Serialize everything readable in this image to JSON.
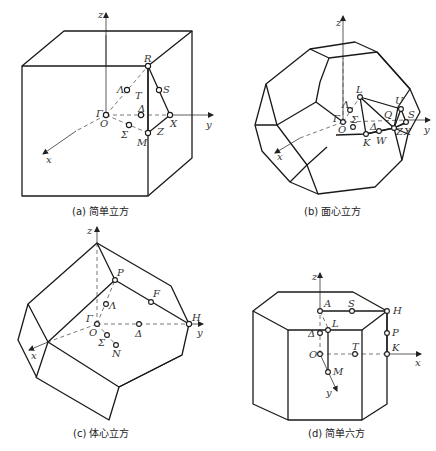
{
  "figure": {
    "panels": [
      {
        "id": "a",
        "caption": "(a) 简单立方",
        "axes": {
          "x": "x",
          "y": "y",
          "z": "z"
        },
        "points": {
          "Gamma": "Γ",
          "O": "O",
          "R": "R",
          "S": "S",
          "T": "T",
          "Lambda": "Λ",
          "Delta": "Δ",
          "X": "X",
          "Z": "Z",
          "M": "M",
          "Sigma": "Σ"
        }
      },
      {
        "id": "b",
        "caption": "(b) 面心立方",
        "axes": {
          "x": "x",
          "y": "y",
          "z": "z"
        },
        "points": {
          "Gamma": "Γ",
          "O": "O",
          "L": "L",
          "Lambda": "Λ",
          "Sigma": "Σ",
          "U": "U",
          "Q": "Q",
          "S": "S",
          "Delta": "Δ",
          "K": "K",
          "W": "W",
          "Z": "Z",
          "X": "X"
        }
      },
      {
        "id": "c",
        "caption": "(c) 体心立方",
        "axes": {
          "x": "x",
          "y": "y",
          "z": "z"
        },
        "points": {
          "Gamma": "Γ",
          "O": "O",
          "P": "P",
          "Lambda": "Λ",
          "F": "F",
          "H": "H",
          "Delta": "Δ",
          "Sigma": "Σ",
          "N": "N"
        }
      },
      {
        "id": "d",
        "caption": "(d) 简单六方",
        "axes": {
          "x": "x",
          "y": "y",
          "z": "z"
        },
        "points": {
          "A": "A",
          "S": "S",
          "H": "H",
          "L": "L",
          "Delta": "Δ",
          "P": "P",
          "O": "O",
          "T": "T",
          "K": "K",
          "M": "M"
        }
      }
    ]
  }
}
